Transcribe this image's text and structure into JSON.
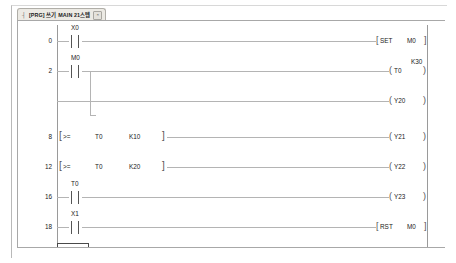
{
  "window": {
    "tab": {
      "prefix": "┤",
      "label": "[PRG] 쓰기 MAIN 21스텝",
      "close_icon": "×"
    }
  },
  "ladder": {
    "program_name": "MAIN",
    "rungs": [
      {
        "step": "0",
        "contacts": [
          {
            "label": "X0",
            "type": "no"
          }
        ],
        "instruction": {
          "name": "SET",
          "operand": "M0"
        }
      },
      {
        "step": "2",
        "contacts": [
          {
            "label": "M0",
            "type": "no"
          }
        ],
        "branch": true,
        "coil": {
          "label": "T0",
          "preset": "K30"
        }
      },
      {
        "step": "",
        "contacts": [],
        "coil": {
          "label": "Y20",
          "preset": ""
        }
      },
      {
        "step": "8",
        "compare": {
          "op": ">=",
          "a": "T0",
          "b": "K10"
        },
        "coil": {
          "label": "Y21",
          "preset": ""
        }
      },
      {
        "step": "12",
        "compare": {
          "op": ">=",
          "a": "T0",
          "b": "K20"
        },
        "coil": {
          "label": "Y22",
          "preset": ""
        }
      },
      {
        "step": "16",
        "contacts": [
          {
            "label": "T0",
            "type": "no"
          }
        ],
        "coil": {
          "label": "Y23",
          "preset": ""
        }
      },
      {
        "step": "18",
        "contacts": [
          {
            "label": "X1",
            "type": "no"
          }
        ],
        "instruction": {
          "name": "RST",
          "operand": "M0"
        }
      },
      {
        "step": "20",
        "contacts": [],
        "cursor": true,
        "instruction": {
          "name": "END",
          "operand": ""
        }
      }
    ],
    "symbols": {
      "coil_open": "(",
      "coil_close": ")",
      "inst_open": "[",
      "inst_close": "]",
      "cmp_open": "[",
      "cmp_close": "]"
    }
  }
}
